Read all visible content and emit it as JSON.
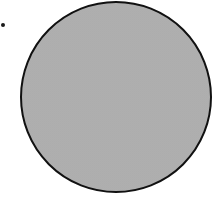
{
  "figure": {
    "shapes": [
      {
        "type": "dot",
        "name": "marker-dot",
        "cx": 3,
        "cy": 25,
        "radius": 2,
        "color": "#1a1a1a"
      },
      {
        "type": "circle",
        "name": "filled-circle",
        "cx": 116,
        "cy": 97,
        "radius": 96,
        "fill": "#c2c2c2",
        "fill_pattern": "stipple",
        "stroke": "#111111",
        "stroke_width": 2
      }
    ]
  }
}
